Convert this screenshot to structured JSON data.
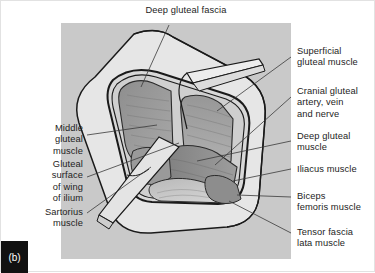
{
  "figure": {
    "tag": "(b)",
    "panel_color": "#c9c9c9",
    "background_color": "#ffffff",
    "leader_color": "#3a3a3a",
    "outline_color": "#1a1a1a"
  },
  "labels": {
    "top": {
      "text": "Deep gluteal fascia",
      "side": "center"
    },
    "left": [
      {
        "text": "Middle\ngluteal\nmuscle"
      },
      {
        "text": "Gluteal\nsurface\nof wing\nof ilium"
      },
      {
        "text": "Sartorius\nmuscle"
      }
    ],
    "right": [
      {
        "text": "Superficial\ngluteal muscle"
      },
      {
        "text": "Cranial gluteal\nartery, vein\nand nerve"
      },
      {
        "text": "Deep gluteal\nmuscle"
      },
      {
        "text": "Iliacus muscle"
      },
      {
        "text": "Biceps\nfemoris muscle"
      },
      {
        "text": "Tensor fascia\nlata muscle"
      }
    ]
  },
  "illustration": {
    "title": "Dissection of the gluteal region",
    "structures": [
      "deep gluteal fascia sheet",
      "reflected fascia flap",
      "superficial gluteal muscle",
      "middle gluteal muscle",
      "deep gluteal muscle",
      "iliacus muscle",
      "biceps femoris muscle",
      "tensor fascia lata muscle",
      "sartorius muscle band",
      "cranial gluteal artery, vein and nerve"
    ]
  }
}
